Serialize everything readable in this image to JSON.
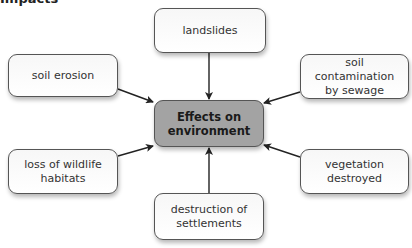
{
  "heading_fragment": "Impacts",
  "diagram": {
    "center": {
      "label": "Effects on\nenvironment",
      "fill": "#a3a3a3"
    },
    "nodes": [
      {
        "id": "landslides",
        "label": "landslides"
      },
      {
        "id": "soil-erosion",
        "label": "soil erosion"
      },
      {
        "id": "soil-contamination",
        "label": "soil contamination\nby sewage"
      },
      {
        "id": "loss-of-habitats",
        "label": "loss of wildlife\nhabitats"
      },
      {
        "id": "vegetation-destroyed",
        "label": "vegetation\ndestroyed"
      },
      {
        "id": "destruction-of-settlements",
        "label": "destruction of\nsettlements"
      }
    ],
    "edges": [
      {
        "from": "landslides",
        "to": "center"
      },
      {
        "from": "soil-erosion",
        "to": "center"
      },
      {
        "from": "soil-contamination",
        "to": "center"
      },
      {
        "from": "loss-of-habitats",
        "to": "center"
      },
      {
        "from": "vegetation-destroyed",
        "to": "center"
      },
      {
        "from": "destruction-of-settlements",
        "to": "center"
      }
    ]
  }
}
